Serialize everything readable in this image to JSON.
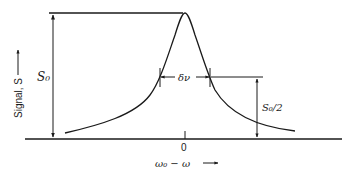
{
  "figure": {
    "type": "lorentzian-lineshape",
    "y_axis_label": "Signal, S",
    "x_axis_label": "ω₀ − ω",
    "x_origin_label": "0",
    "peak_height_label": "S₀",
    "half_height_label": "S₀/2",
    "width_label": "δν"
  },
  "colors": {
    "ink": "#1a1a1a",
    "background": "#ffffff"
  }
}
